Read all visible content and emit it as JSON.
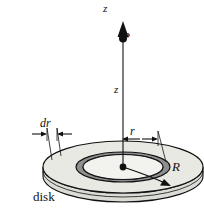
{
  "figure": {
    "name": "electric-field-on-axis-of-charged-disk",
    "caption": "disk",
    "labels": {
      "axis": "z",
      "point": "P",
      "distance": "z",
      "ring_width": "dr",
      "ring_radius": "r",
      "disk_radius": "R",
      "base": "disk"
    },
    "colors": {
      "outline": "#111111",
      "disk_face": "#e9e9e4",
      "ring_face": "#8e8e8e",
      "ring_inner_face": "#f2f2ee",
      "edge_face": "#dcdcd6",
      "background": "#ffffff"
    },
    "geometry": {
      "center": {
        "x": 123,
        "y": 167
      },
      "disk_rx": 80,
      "disk_ry": 26,
      "disk_thickness": 9,
      "ring_outer_rx": 47,
      "ring_outer_ry": 15,
      "ring_inner_rx": 40,
      "ring_inner_ry": 12.5,
      "axis_top_y": 22,
      "point_p_y": 38,
      "dim_dr_left_x": 47,
      "dim_dr_right_x": 57,
      "dim_r_right_x": 158,
      "dim_dr_rule_y": 134,
      "dim_r_rule_y": 139
    }
  }
}
